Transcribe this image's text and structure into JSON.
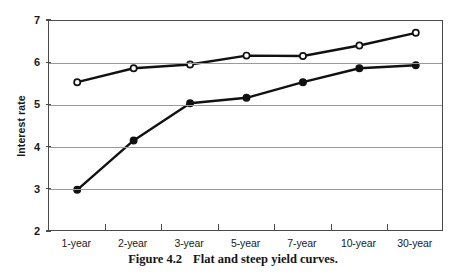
{
  "figure": {
    "caption_number": "Figure 4.2",
    "caption_text": "Flat and steep yield curves."
  },
  "chart_data": {
    "type": "line",
    "title": "",
    "subtitle": "",
    "xlabel": "",
    "ylabel": "Interest rate",
    "categories": [
      "1-year",
      "2-year",
      "3-year",
      "5-year",
      "7-year",
      "10-year",
      "30-year"
    ],
    "ylim": [
      2,
      7
    ],
    "yticks": [
      2,
      3,
      4,
      5,
      6,
      7
    ],
    "ytick_labels": [
      "2",
      "3",
      "4",
      "5",
      "6",
      "7"
    ],
    "grid": "horizontal",
    "legend": "none",
    "series": [
      {
        "name": "Flat yield curve",
        "marker": "open-circle",
        "color": "#111111",
        "values": [
          5.55,
          5.88,
          5.97,
          6.18,
          6.17,
          6.42,
          6.72
        ]
      },
      {
        "name": "Steep yield curve",
        "marker": "filled-circle",
        "color": "#111111",
        "values": [
          3.0,
          4.17,
          5.05,
          5.18,
          5.55,
          5.88,
          5.95
        ]
      }
    ]
  }
}
